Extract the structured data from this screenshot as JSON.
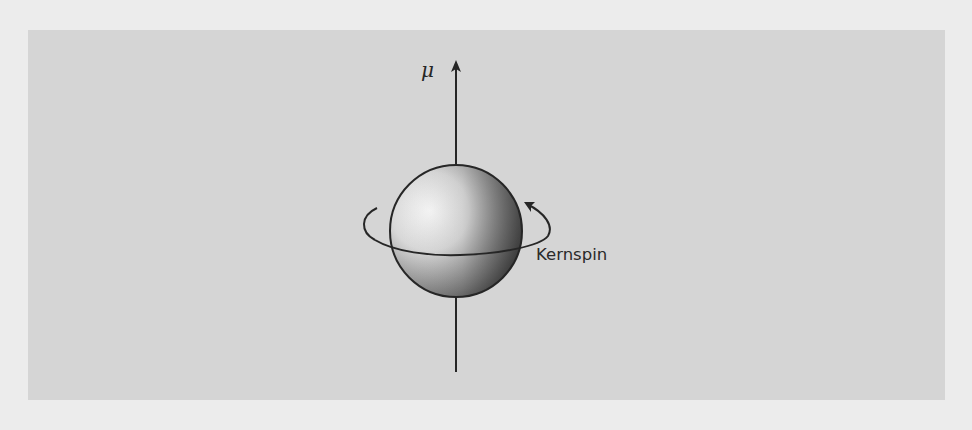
{
  "figure": {
    "type": "nuclear-spin-diagram",
    "labels": {
      "magnetic_moment": "μ",
      "spin": "Kernspin"
    },
    "colors": {
      "page_background": "#ececec",
      "panel_background": "#d5d5d5",
      "stroke": "#262626",
      "sphere_highlight": "#f4f4f4",
      "sphere_shadow": "#3e3e3e"
    }
  }
}
